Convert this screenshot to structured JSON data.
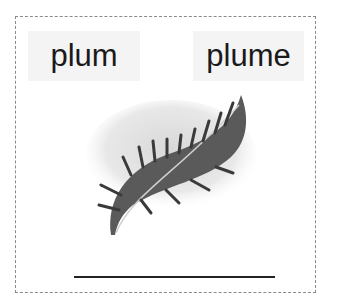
{
  "card": {
    "options": [
      {
        "label": "plum"
      },
      {
        "label": "plume"
      }
    ],
    "image": {
      "icon": "feather-plume-illustration"
    },
    "answer_line": {
      "value": ""
    }
  },
  "colors": {
    "text": "#1a1a1a",
    "option_bg": "#f4f4f4",
    "border": "#8a8a8a",
    "line": "#222222"
  }
}
